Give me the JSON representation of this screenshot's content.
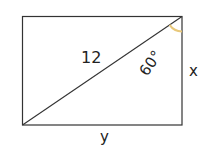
{
  "diagram": {
    "type": "rectangle-with-diagonal",
    "rectangle": {
      "x": 22,
      "y": 16,
      "width": 160,
      "height": 109
    },
    "labels": {
      "diagonal": "12",
      "angle": "60°",
      "side_right": "x",
      "side_bottom": "y"
    },
    "colors": {
      "stroke": "#333333",
      "angle_arc": "#e8c87a"
    }
  }
}
